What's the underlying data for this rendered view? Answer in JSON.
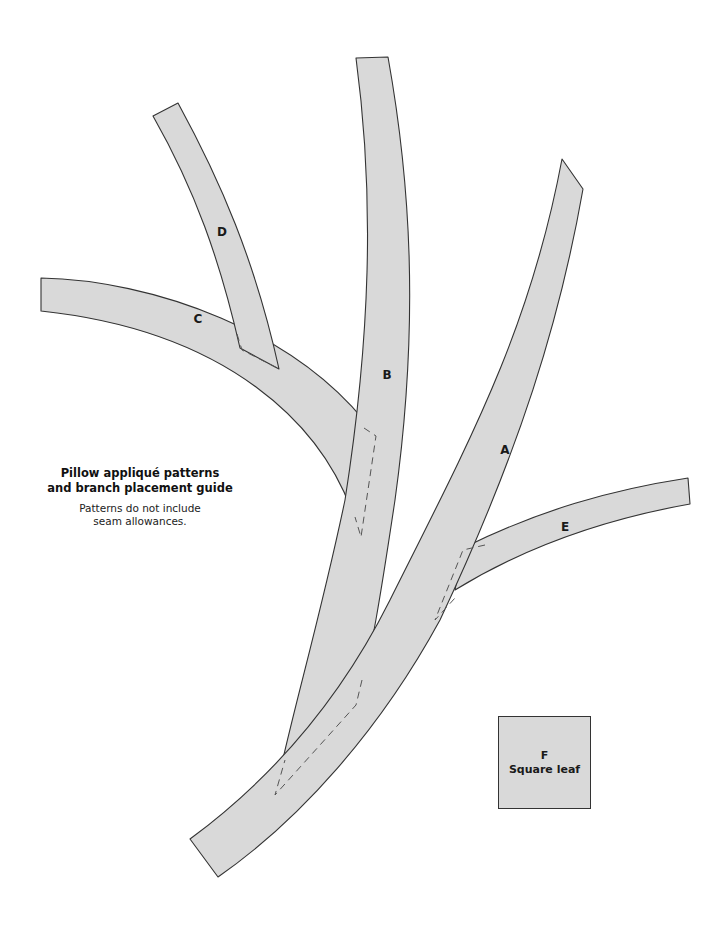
{
  "caption": {
    "title_line1": "Pillow appliqué patterns",
    "title_line2": "and branch placement guide",
    "note_line1": "Patterns do not include",
    "note_line2": "seam allowances."
  },
  "pieces": {
    "A": {
      "label": "A"
    },
    "B": {
      "label": "B"
    },
    "C": {
      "label": "C"
    },
    "D": {
      "label": "D"
    },
    "E": {
      "label": "E"
    },
    "F": {
      "label": "F",
      "name": "Square leaf"
    }
  },
  "colors": {
    "fill": "#d9d9d9",
    "stroke": "#333333",
    "background": "#ffffff"
  }
}
